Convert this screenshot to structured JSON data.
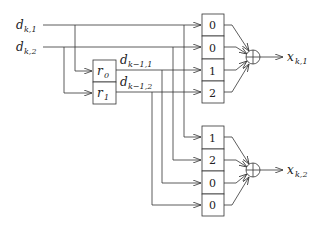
{
  "diagram": {
    "type": "signal-flow / mapping diagram",
    "inputs": [
      {
        "id": "d_k1",
        "symbol": "d",
        "subscript": "k,1"
      },
      {
        "id": "d_k2",
        "symbol": "d",
        "subscript": "k,2"
      }
    ],
    "registers": [
      {
        "id": "r0",
        "symbol": "r",
        "subscript": "0",
        "output_symbol": "d",
        "output_subscript": "k−1,1"
      },
      {
        "id": "r1",
        "symbol": "r",
        "subscript": "1",
        "output_symbol": "d",
        "output_subscript": "k−1,2"
      }
    ],
    "upper_weights": [
      "0",
      "0",
      "1",
      "2"
    ],
    "lower_weights": [
      "1",
      "2",
      "0",
      "0"
    ],
    "outputs": [
      {
        "id": "x_k1",
        "symbol": "x",
        "subscript": "k,1"
      },
      {
        "id": "x_k2",
        "symbol": "x",
        "subscript": "k,2"
      }
    ],
    "adder_symbol": "⊕"
  }
}
